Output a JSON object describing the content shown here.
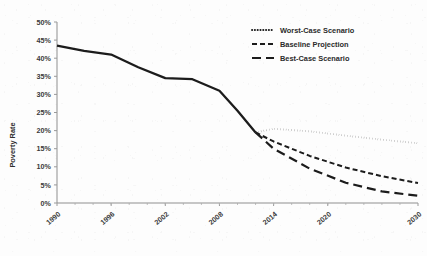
{
  "chart_data": {
    "type": "line",
    "title": "",
    "xlabel": "",
    "ylabel": "Poverty Rate",
    "xlim": [
      1990,
      2030
    ],
    "ylim": [
      0,
      50
    ],
    "y_tick_labels": [
      "0%",
      "5%",
      "10%",
      "15%",
      "20%",
      "25%",
      "30%",
      "35%",
      "40%",
      "45%",
      "50%"
    ],
    "y_tick_values": [
      0,
      5,
      10,
      15,
      20,
      25,
      30,
      35,
      40,
      45,
      50
    ],
    "x_tick_labels": [
      "1990",
      "1996",
      "2002",
      "2008",
      "2014",
      "2020",
      "2030"
    ],
    "x_tick_values": [
      1990,
      1996,
      2002,
      2008,
      2014,
      2020,
      2030
    ],
    "grid": false,
    "legend_position": "top-right",
    "series": [
      {
        "name": "Historical",
        "style": "solid",
        "in_legend": false,
        "x": [
          1990,
          1993,
          1996,
          1999,
          2002,
          2005,
          2008,
          2010,
          2012
        ],
        "values": [
          43.5,
          42.0,
          41.0,
          37.5,
          34.5,
          34.2,
          31.0,
          25.5,
          19.5
        ]
      },
      {
        "name": "Worst-Case Scenario",
        "style": "dotted",
        "in_legend": true,
        "x": [
          2012,
          2014,
          2018,
          2022,
          2026,
          2030
        ],
        "values": [
          19.5,
          20.5,
          19.8,
          18.6,
          17.5,
          16.5
        ]
      },
      {
        "name": "Baseline Projection",
        "style": "dashed",
        "in_legend": true,
        "x": [
          2012,
          2014,
          2018,
          2022,
          2026,
          2030
        ],
        "values": [
          19.5,
          17.0,
          13.0,
          9.8,
          7.4,
          5.5
        ]
      },
      {
        "name": "Best-Case Scenario",
        "style": "long-dash",
        "in_legend": true,
        "x": [
          2012,
          2014,
          2018,
          2022,
          2026,
          2030
        ],
        "values": [
          19.5,
          15.0,
          9.5,
          5.6,
          3.2,
          2.0
        ]
      }
    ],
    "legend": [
      {
        "label": "Worst-Case Scenario",
        "style": "dotted"
      },
      {
        "label": "Baseline Projection",
        "style": "dashed"
      },
      {
        "label": "Best-Case Scenario",
        "style": "long-dash"
      }
    ],
    "colors": {
      "line": "#1c1c1c",
      "axis": "#8f8f8f",
      "text": "#3a3a3a",
      "background": "#fdfdfd"
    }
  }
}
